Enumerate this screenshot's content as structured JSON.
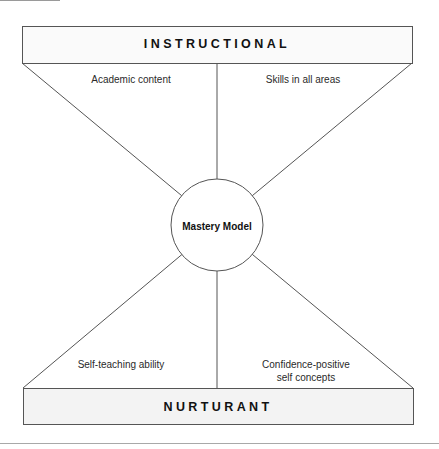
{
  "diagram": {
    "top_box": {
      "title": "INSTRUCTIONAL"
    },
    "bottom_box": {
      "title": "NURTURANT"
    },
    "center": {
      "label": "Mastery Model"
    },
    "quadrants": {
      "top_left": "Academic content",
      "top_right": "Skills in all areas",
      "bottom_left": "Self-teaching ability",
      "bottom_right_line1": "Confidence-positive",
      "bottom_right_line2": "self concepts"
    },
    "colors": {
      "stroke": "#555555",
      "bottom_box_fill": "#f3f3f3",
      "top_box_fill": "#fafafa"
    }
  }
}
